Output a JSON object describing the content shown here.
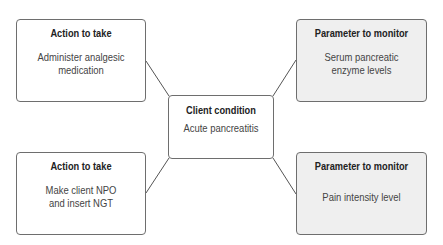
{
  "diagram": {
    "center": {
      "title": "Client condition",
      "body": "Acute pancreatitis"
    },
    "top_left": {
      "title": "Action to take",
      "body_line1": "Administer analgesic",
      "body_line2": "medication"
    },
    "bottom_left": {
      "title": "Action to take",
      "body_line1": "Make client NPO",
      "body_line2": "and insert NGT"
    },
    "top_right": {
      "title": "Parameter to monitor",
      "body_line1": "Serum pancreatic",
      "body_line2": "enzyme levels"
    },
    "bottom_right": {
      "title": "Parameter to monitor",
      "body_line1": "Pain intensity level"
    },
    "colors": {
      "border": "#6e6e6e",
      "shaded_fill": "#efefef",
      "line": "#555555"
    }
  }
}
